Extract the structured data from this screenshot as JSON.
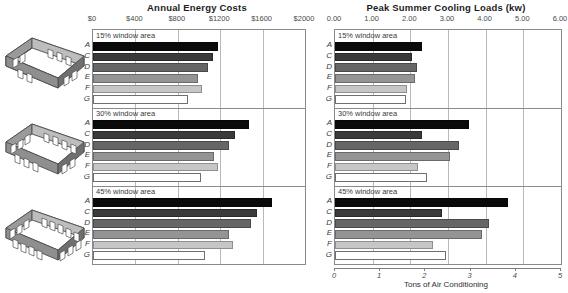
{
  "figure": {
    "buildings": [
      {
        "name": "building-15-percent",
        "windows_per_long_wall": 3,
        "caption": "15% window area"
      },
      {
        "name": "building-30-percent",
        "windows_per_long_wall": 4,
        "caption": "30% window area"
      },
      {
        "name": "building-45-percent",
        "windows_per_long_wall": 5,
        "caption": "45% window area"
      }
    ]
  },
  "chart_data": [
    {
      "id": "annual-energy-costs",
      "type": "bar",
      "orientation": "horizontal",
      "title": "Annual Energy Costs",
      "xlabel": "",
      "ylabel": "",
      "xlim": [
        0,
        2000
      ],
      "xticks": [
        0,
        400,
        800,
        1200,
        1600,
        2000
      ],
      "xticklabels": [
        "$0",
        "$400",
        "$800",
        "$1200",
        "$1600",
        "$2000"
      ],
      "grid": true,
      "legend": "none",
      "categories": [
        "A",
        "C",
        "D",
        "E",
        "F",
        "G"
      ],
      "panels": [
        {
          "label": "15% window area",
          "values": [
            1180,
            1130,
            1085,
            995,
            1030,
            900
          ]
        },
        {
          "label": "30% window area",
          "values": [
            1470,
            1335,
            1280,
            1140,
            1180,
            1020
          ]
        },
        {
          "label": "45% window area",
          "values": [
            1690,
            1545,
            1490,
            1280,
            1320,
            1060
          ]
        }
      ]
    },
    {
      "id": "peak-summer-cooling-loads",
      "type": "bar",
      "orientation": "horizontal",
      "title": "Peak Summer Cooling Loads (kw)",
      "xlabel": "Tons of Air Conditioning",
      "ylabel": "",
      "xlim": [
        0,
        6
      ],
      "xticks": [
        0,
        1,
        2,
        3,
        4,
        5,
        6
      ],
      "xticklabels": [
        "0.00",
        "1.00",
        "2.00",
        "3.00",
        "4.00",
        "5.00",
        "6.00"
      ],
      "secondary_axis": {
        "label": "Tons of Air Conditioning",
        "ticks": [
          0,
          1,
          2,
          3,
          4,
          5
        ],
        "ticklabels": [
          "0",
          "1",
          "2",
          "3",
          "4",
          "5"
        ],
        "lim": [
          0,
          5
        ]
      },
      "grid": true,
      "legend": "none",
      "categories": [
        "A",
        "C",
        "D",
        "E",
        "F",
        "G"
      ],
      "panels": [
        {
          "label": "15% window area",
          "values": [
            2.3,
            2.05,
            2.18,
            2.12,
            1.9,
            1.88
          ]
        },
        {
          "label": "30% window area",
          "values": [
            3.55,
            2.3,
            3.3,
            3.05,
            2.2,
            2.45
          ]
        },
        {
          "label": "45% window area",
          "values": [
            4.6,
            2.85,
            4.1,
            3.9,
            2.6,
            2.95
          ]
        }
      ]
    }
  ],
  "colors": {
    "series_A": "#0a0a0a",
    "series_C": "#3a3a3a",
    "series_D": "#666666",
    "series_E": "#949494",
    "series_F": "#c6c6c6",
    "series_G": "#ffffff",
    "frame": "#8a8a8a",
    "grid": "#b9b9b9",
    "text": "#2b2b2b",
    "building_face_dark": "#808080",
    "building_face_light": "#bdbdbd",
    "building_floor": "#ffffff"
  }
}
